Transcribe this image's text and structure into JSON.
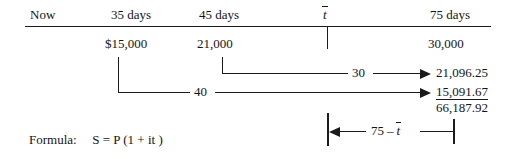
{
  "figure": {
    "type": "timeline-diagram",
    "caption_formula_prefix": "Formula:",
    "formula": {
      "s": "S",
      "eq": "=",
      "p": "P",
      "open": "(1 +",
      "it": "it",
      "close": ")"
    }
  },
  "timeline": {
    "headers": [
      {
        "label": "Now"
      },
      {
        "label": "35 days"
      },
      {
        "label": "45 days"
      },
      {
        "label": "t",
        "overline": true
      },
      {
        "label": "75 days"
      }
    ],
    "amounts": [
      {
        "label": "$15,000"
      },
      {
        "label": "21,000"
      },
      {
        "label": "30,000"
      }
    ]
  },
  "flows": [
    {
      "name": "flow-21000",
      "days": "30",
      "result": "21,096.25"
    },
    {
      "name": "flow-15000",
      "days": "40",
      "result": "15,091.67"
    }
  ],
  "total": "66,187.92",
  "measure": {
    "seventyfive": "75",
    "minus": "–",
    "tbar": "t"
  },
  "colors": {
    "ink": "#1b1b1b",
    "text": "#141414",
    "background": "#ffffff"
  }
}
